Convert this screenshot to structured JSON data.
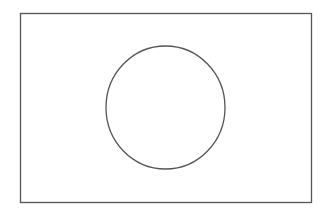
{
  "diagram": {
    "canvas": {
      "width": 333,
      "height": 210,
      "background": "#ffffff"
    },
    "shapes": [
      {
        "type": "rectangle",
        "x": 20.5,
        "y": 13.5,
        "width": 291,
        "height": 189,
        "stroke": "#555555",
        "stroke_width": 1.3,
        "fill": "none"
      },
      {
        "type": "ellipse",
        "cx": 165.5,
        "cy": 107.5,
        "rx": 59.5,
        "ry": 61.5,
        "stroke": "#555555",
        "stroke_width": 1.3,
        "fill": "none"
      }
    ]
  }
}
